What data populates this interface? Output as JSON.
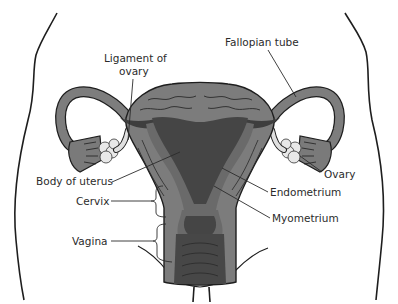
{
  "diagram": {
    "type": "anatomical-illustration",
    "colors": {
      "background": "#ffffff",
      "tissue_light": "#8c8c8c",
      "tissue_mid": "#6f6f6f",
      "tissue_dark": "#474747",
      "ovary": "#e6e6e6",
      "outline": "#1e1e1e",
      "text": "#2b2b2b"
    },
    "labels": {
      "ligament_of_ovary_line1": "Ligament of",
      "ligament_of_ovary_line2": "ovary",
      "fallopian_tube": "Fallopian tube",
      "body_of_uterus": "Body of uterus",
      "ovary": "Ovary",
      "cervix": "Cervix",
      "endometrium": "Endometrium",
      "myometrium": "Myometrium",
      "vagina": "Vagina"
    }
  }
}
